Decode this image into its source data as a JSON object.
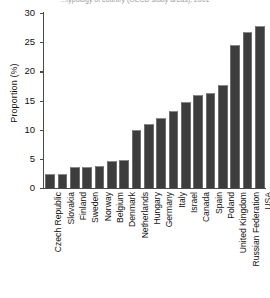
{
  "figure": {
    "title_partial": "...typology of country (OECD study areas), 2001",
    "background": "#ffffff",
    "bar_color": "#3d3d3d",
    "axis_color": "#4a4a4a"
  },
  "chart_data": {
    "type": "bar",
    "title": "",
    "xlabel": "",
    "ylabel": "Proportion (%)",
    "ylim": [
      0,
      30
    ],
    "yticks": [
      0,
      5,
      10,
      15,
      20,
      25,
      30
    ],
    "ytick_labels": [
      "0",
      "5",
      "10",
      "15",
      "20",
      "25",
      "30"
    ],
    "grid": false,
    "legend": null,
    "categories": [
      "Czech Republic",
      "Slovakia",
      "Finland",
      "Sweden",
      "Norway",
      "Belgium",
      "Denmark",
      "Netherlands",
      "Hungary",
      "Germany",
      "Italy",
      "Israel",
      "Canada",
      "Spain",
      "Poland",
      "United Kingdom",
      "Russian Federation",
      "USA"
    ],
    "values": [
      2.4,
      2.4,
      3.6,
      3.6,
      3.7,
      4.7,
      4.8,
      10.0,
      11.0,
      12.0,
      13.2,
      14.8,
      16.0,
      16.3,
      17.6,
      24.6,
      26.7,
      27.7
    ]
  }
}
